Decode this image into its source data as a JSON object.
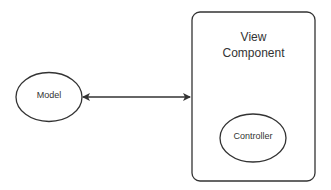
{
  "diagram": {
    "nodes": {
      "model": {
        "label": "Model"
      },
      "view_component": {
        "label_line1": "View",
        "label_line2": "Component"
      },
      "controller": {
        "label": "Controller"
      }
    },
    "edges": [
      {
        "from": "model",
        "to": "view_component",
        "type": "bidirectional-arrow"
      }
    ],
    "colors": {
      "stroke": "#333333",
      "text": "#333333",
      "background": "#ffffff"
    }
  }
}
